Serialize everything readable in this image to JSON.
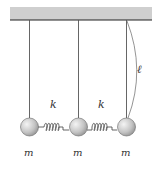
{
  "diagram": {
    "ceiling_color": "#cfcfcf",
    "string_color": "#444444",
    "mass_color": "#bdbdbd",
    "labels": {
      "spring_left": "k",
      "spring_right": "k",
      "length": "ℓ",
      "mass_left": "m",
      "mass_middle": "m",
      "mass_right": "m"
    }
  }
}
